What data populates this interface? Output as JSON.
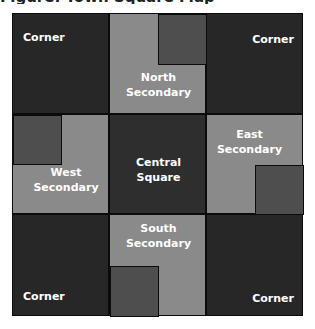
{
  "title": "Figure: Town Square Map",
  "colors": {
    "corner": "#272727",
    "secondary": "#8a8a8a",
    "central": "#2e2e2e",
    "inset": "#4e4e4e"
  },
  "cells": {
    "nw": {
      "label": "Corner"
    },
    "ne": {
      "label": "Corner"
    },
    "sw": {
      "label": "Corner"
    },
    "se": {
      "label": "Corner"
    },
    "north": {
      "label_line1": "North",
      "label_line2": "Secondary"
    },
    "south": {
      "label_line1": "South",
      "label_line2": "Secondary"
    },
    "west": {
      "label_line1": "West",
      "label_line2": "Secondary"
    },
    "east": {
      "label_line1": "East",
      "label_line2": "Secondary"
    },
    "center": {
      "label_line1": "Central",
      "label_line2": "Square"
    }
  }
}
